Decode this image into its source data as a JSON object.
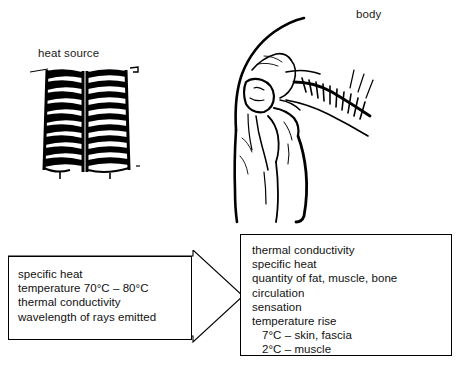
{
  "diagram": {
    "labels": {
      "heat_source": "heat source",
      "body": "body"
    },
    "illustrations": {
      "heat_source_icon": "radiator-heat-source-drawing",
      "body_icon": "anatomical-shoulder-arm-drawing"
    },
    "source_properties": {
      "lines": [
        {
          "text": "specific heat",
          "indent": false
        },
        {
          "text": "temperature 70°C – 80°C",
          "indent": false
        },
        {
          "text": "thermal conductivity",
          "indent": false
        },
        {
          "text": "wavelength of rays emitted",
          "indent": false
        }
      ]
    },
    "body_properties": {
      "lines": [
        {
          "text": "thermal conductivity",
          "indent": false
        },
        {
          "text": "specific heat",
          "indent": false
        },
        {
          "text": "quantity of fat, muscle, bone",
          "indent": false
        },
        {
          "text": "circulation",
          "indent": false
        },
        {
          "text": "sensation",
          "indent": false
        },
        {
          "text": "temperature rise",
          "indent": false
        },
        {
          "text": "7°C – skin, fascia",
          "indent": true
        },
        {
          "text": "2°C – muscle",
          "indent": true
        }
      ]
    },
    "arrow": {
      "name": "heat-transfer-arrow",
      "direction": "left-to-right"
    },
    "colors": {
      "ink": "#000000",
      "background": "#ffffff"
    }
  }
}
